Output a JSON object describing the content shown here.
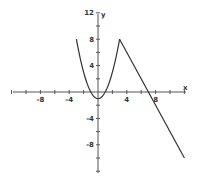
{
  "chart_data": {
    "type": "line",
    "title": "",
    "xlabel": "x",
    "ylabel": "y",
    "xlim": [
      -12,
      12
    ],
    "ylim": [
      -12,
      12
    ],
    "grid": false,
    "x_ticks": [
      -8,
      -4,
      4,
      8
    ],
    "y_ticks": [
      12,
      8,
      4,
      -4,
      -8
    ],
    "x_tick_labels": [
      "-8",
      "-4",
      "4",
      "8"
    ],
    "y_tick_labels": [
      "12",
      "8",
      "4",
      "-4",
      "-8"
    ],
    "series": [
      {
        "name": "piece-1 parabola",
        "expression": "y = x^2 - 1",
        "domain": [
          -3,
          3
        ],
        "x": [
          -3,
          -2.5,
          -2,
          -1.5,
          -1,
          -0.5,
          0,
          0.5,
          1,
          1.5,
          2,
          2.5,
          3
        ],
        "y": [
          8,
          5.25,
          3,
          1.25,
          0,
          -0.75,
          -1,
          -0.75,
          0,
          1.25,
          3,
          5.25,
          8
        ]
      },
      {
        "name": "piece-2 line",
        "expression": "y = -2x + 14",
        "domain": [
          3,
          12
        ],
        "x": [
          3,
          7,
          12
        ],
        "y": [
          8,
          0,
          -10
        ]
      }
    ],
    "color": "#333333"
  }
}
